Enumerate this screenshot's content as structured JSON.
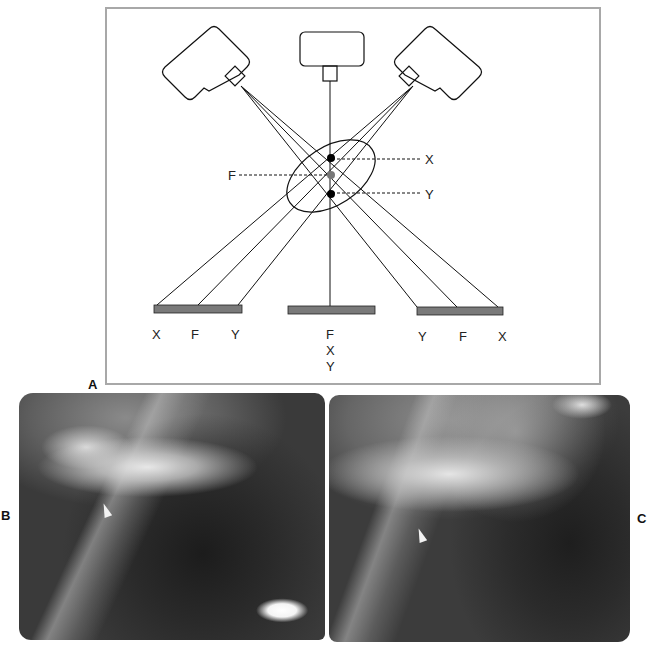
{
  "figure": {
    "panel_labels": {
      "a": "A",
      "b": "B",
      "c": "C"
    },
    "diagram": {
      "title": "Tomographic blurring geometry",
      "tubes": [
        "left-oblique-tube",
        "center-tube",
        "right-oblique-tube"
      ],
      "point_labels": {
        "x": "X",
        "f": "F",
        "y": "Y"
      },
      "left_film_labels": [
        "X",
        "F",
        "Y"
      ],
      "center_film_labels": [
        "F",
        "X",
        "Y"
      ],
      "right_film_labels": [
        "Y",
        "F",
        "X"
      ],
      "colors": {
        "line": "#111111",
        "film": "#7a7a7a",
        "focal_point": "#777777",
        "frame": "#a8a8a8"
      }
    },
    "radiographs": {
      "b": {
        "description": "radiograph with white arrowhead",
        "marker": "arrowhead"
      },
      "c": {
        "description": "radiograph with white arrowhead",
        "marker": "arrowhead"
      }
    }
  }
}
